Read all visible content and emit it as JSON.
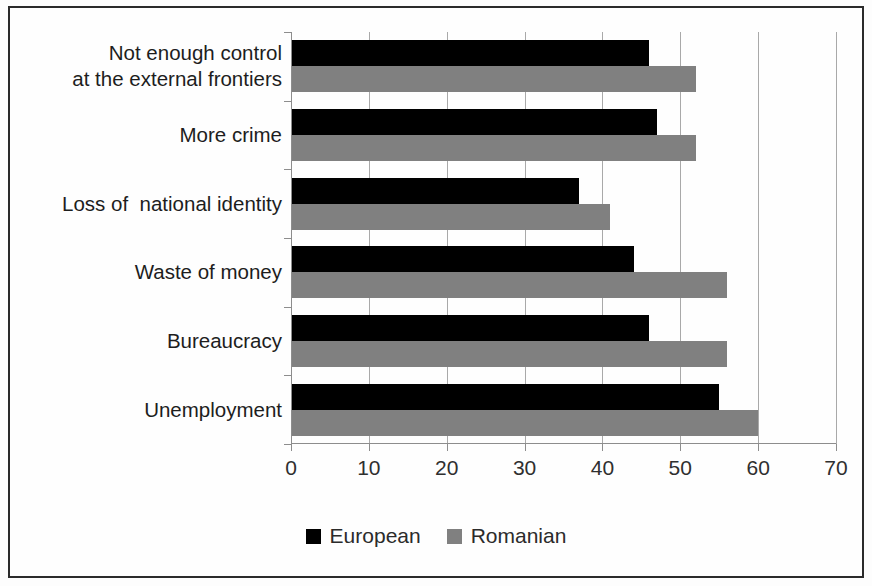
{
  "chart_data": {
    "type": "bar",
    "orientation": "horizontal",
    "title": "",
    "subtitle": "",
    "xlabel": "",
    "ylabel": "",
    "xlim": [
      0,
      70
    ],
    "xticks": [
      0,
      10,
      20,
      30,
      40,
      50,
      60,
      70
    ],
    "xtick_labels": [
      "0",
      "10",
      "20",
      "30",
      "40",
      "50",
      "60",
      "70"
    ],
    "grid": true,
    "grid_axis": "x",
    "legend_position": "bottom",
    "categories": [
      "Not enough control\nat the external frontiers",
      "More crime",
      "Loss of  national identity",
      "Waste of money",
      "Bureaucracy",
      "Unemployment"
    ],
    "series": [
      {
        "name": "European",
        "color": "#000000",
        "values": [
          46,
          47,
          37,
          44,
          46,
          55
        ]
      },
      {
        "name": "Romanian",
        "color": "#808080",
        "values": [
          52,
          52,
          41,
          56,
          56,
          60
        ]
      }
    ]
  },
  "legend": {
    "items": [
      {
        "label": "European",
        "color": "#000000"
      },
      {
        "label": "Romanian",
        "color": "#808080"
      }
    ]
  },
  "axis": {
    "x_tick_labels": [
      "0",
      "10",
      "20",
      "30",
      "40",
      "50",
      "60",
      "70"
    ]
  },
  "colors": {
    "series_european": "#000000",
    "series_romanian": "#808080",
    "frame": "#2b2b2b",
    "grid": "#a9a9a9",
    "background": "#fefefe"
  }
}
